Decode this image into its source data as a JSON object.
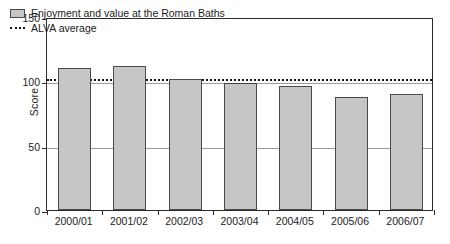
{
  "chart_data": {
    "type": "bar",
    "title": "",
    "xlabel": "",
    "ylabel": "Score",
    "categories": [
      "2000/01",
      "2001/02",
      "2002/03",
      "2003/04",
      "2004/05",
      "2005/06",
      "2006/07"
    ],
    "series": [
      {
        "name": "Enjoyment and value at the Roman Baths",
        "values": [
          110,
          112,
          102,
          99,
          96,
          88,
          90
        ]
      }
    ],
    "reference_line": {
      "name": "ALVA average",
      "value": 103,
      "style": "dotted"
    },
    "ylim": [
      0,
      150
    ],
    "yticks": [
      0,
      50,
      100,
      150
    ],
    "ytick_labels": [
      "0",
      "50",
      "100",
      "150"
    ],
    "grid": "horizontal",
    "legend_position": "top-left",
    "colors": {
      "bar_fill": "#c6c6c6",
      "bar_edge": "#4a4a4a",
      "axis": "#2b2b2b",
      "grid": "#9a9a9a",
      "reference_line": "#111111",
      "text": "#1c1c1c",
      "background": "#ffffff"
    }
  },
  "legend": {
    "items": [
      {
        "label": "Enjoyment and value at the Roman Baths",
        "marker": "filled-square-swatch"
      },
      {
        "label": "ALVA average",
        "marker": "dotted-line-swatch"
      }
    ]
  }
}
